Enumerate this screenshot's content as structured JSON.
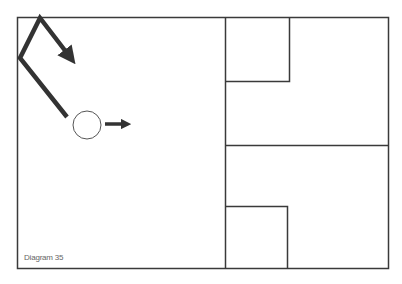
{
  "diagram": {
    "caption": "Diagram 35",
    "colors": {
      "line": "#3a3a3a",
      "path": "#333333",
      "background": "#ffffff"
    },
    "elements": [
      {
        "type": "outer-frame",
        "x": 17,
        "y": 17,
        "w": 372,
        "h": 252
      },
      {
        "type": "vertical-divider",
        "x": 225
      },
      {
        "type": "horizontal-divider",
        "y": 145
      },
      {
        "type": "upper-box",
        "x": 225,
        "y": 17,
        "w": 64,
        "h": 64
      },
      {
        "type": "lower-box",
        "x": 225,
        "y": 206,
        "w": 62,
        "h": 63
      },
      {
        "type": "ball",
        "cx": 87,
        "cy": 125,
        "r": 14
      },
      {
        "type": "ball-direction-arrow",
        "from": [
          105,
          124
        ],
        "to": [
          131,
          124
        ]
      },
      {
        "type": "bounce-path",
        "points": [
          [
            67,
            117
          ],
          [
            20,
            58
          ],
          [
            40,
            18
          ],
          [
            72,
            60
          ]
        ]
      }
    ]
  }
}
